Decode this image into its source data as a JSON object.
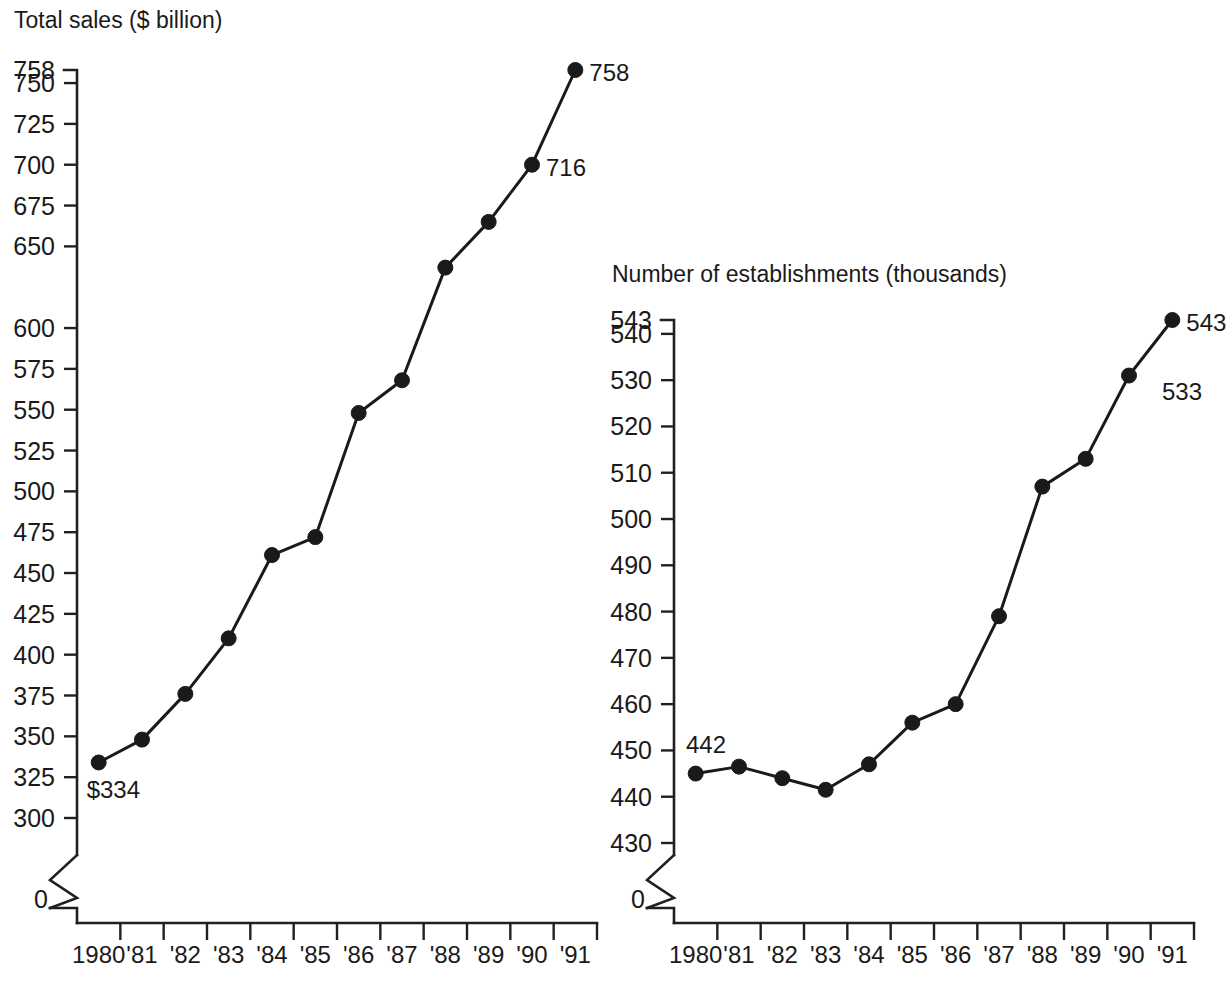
{
  "figure": {
    "background": "#ffffff",
    "ink_color": "#1a1a1a",
    "width": 1232,
    "height": 981
  },
  "chart_data": [
    {
      "id": "total-sales",
      "type": "line",
      "title": "Total sales ($ billion)",
      "xlabel": "",
      "ylabel": "",
      "grid": false,
      "legend": "none",
      "axis_break": true,
      "ylim": [
        300,
        758
      ],
      "zero_tick_label": "0",
      "categories": [
        "1980",
        "'81",
        "'82",
        "'83",
        "'84",
        "'85",
        "'86",
        "'87",
        "'88",
        "'89",
        "'90",
        "'91"
      ],
      "ytick_labels": [
        "758",
        "750",
        "725",
        "700",
        "675",
        "650",
        "600",
        "575",
        "550",
        "525",
        "500",
        "475",
        "450",
        "425",
        "400",
        "375",
        "350",
        "325",
        "300"
      ],
      "ytick_values": [
        758,
        750,
        725,
        700,
        675,
        650,
        600,
        575,
        550,
        525,
        500,
        475,
        450,
        425,
        400,
        375,
        350,
        325,
        300
      ],
      "values": [
        334,
        348,
        376,
        410,
        461,
        472,
        548,
        568,
        637,
        665,
        700,
        758
      ],
      "annotations": [
        {
          "text": "$334",
          "index": 0,
          "position": "below-right"
        },
        {
          "text": "716",
          "index": 10,
          "position": "right"
        },
        {
          "text": "758",
          "index": 11,
          "position": "right"
        }
      ]
    },
    {
      "id": "number-of-establishments",
      "type": "line",
      "title": "Number of establishments (thousands)",
      "xlabel": "",
      "ylabel": "",
      "grid": false,
      "legend": "none",
      "axis_break": true,
      "ylim": [
        430,
        543
      ],
      "zero_tick_label": "0",
      "categories": [
        "1980",
        "'81",
        "'82",
        "'83",
        "'84",
        "'85",
        "'86",
        "'87",
        "'88",
        "'89",
        "'90",
        "'91"
      ],
      "ytick_labels": [
        "543",
        "540",
        "530",
        "520",
        "510",
        "500",
        "490",
        "480",
        "470",
        "460",
        "450",
        "440",
        "430"
      ],
      "ytick_values": [
        543,
        540,
        530,
        520,
        510,
        500,
        490,
        480,
        470,
        460,
        450,
        440,
        430
      ],
      "values": [
        445,
        446.5,
        444,
        441.5,
        447,
        456,
        460,
        479,
        507,
        513,
        531,
        543
      ],
      "annotations": [
        {
          "text": "442",
          "index": 0,
          "position": "above-right"
        },
        {
          "text": "533",
          "index": 10,
          "position": "above-right"
        },
        {
          "text": "543",
          "index": 11,
          "position": "right"
        }
      ]
    }
  ]
}
